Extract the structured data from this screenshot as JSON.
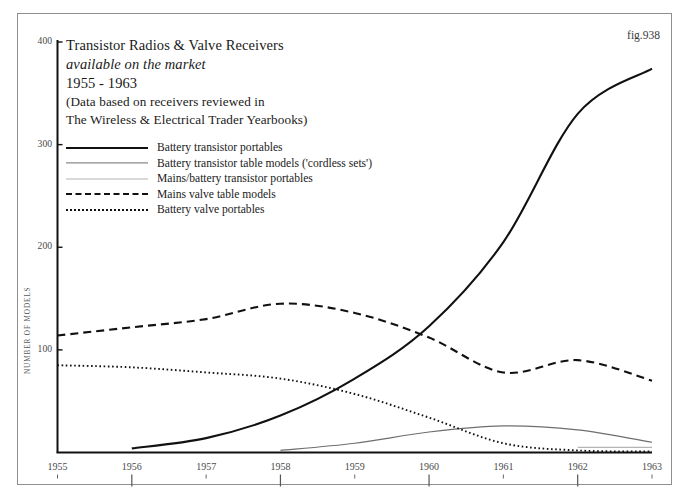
{
  "figure": {
    "fig_label": "fig.938",
    "title_lines": [
      "Transistor Radios & Valve Receivers",
      "available on the market",
      "1955 - 1963",
      "(Data based on receivers reviewed in",
      "The Wireless & Electrical Trader Yearbooks)"
    ]
  },
  "chart_data": {
    "type": "line",
    "title": "Transistor Radios & Valve Receivers available on the market 1955 - 1963",
    "subtitle": "(Data based on receivers reviewed in The Wireless & Electrical Trader Yearbooks)",
    "xlabel": "",
    "ylabel": "NUMBER OF MODELS",
    "xlim": [
      1955,
      1963
    ],
    "ylim": [
      0,
      400
    ],
    "grid": false,
    "legend_position": "upper-left",
    "x": [
      1955,
      1956,
      1957,
      1958,
      1959,
      1960,
      1961,
      1962,
      1963
    ],
    "xticklabels": [
      "1955",
      "1956",
      "1957",
      "1958",
      "1959",
      "1960",
      "1961",
      "1962",
      "1963"
    ],
    "yticks": [
      100,
      200,
      300,
      400
    ],
    "yticklabels": [
      "100",
      "200",
      "300",
      "400"
    ],
    "series": [
      {
        "name": "Battery transistor portables",
        "style": "solid-thick",
        "color": "#111111",
        "values": [
          null,
          4,
          14,
          36,
          72,
          123,
          205,
          330,
          374
        ]
      },
      {
        "name": "Battery transistor table models ('cordless sets')",
        "style": "solid-medium",
        "color": "#6e6e6e",
        "values": [
          null,
          null,
          null,
          2,
          9,
          20,
          26,
          22,
          10
        ]
      },
      {
        "name": "Mains/battery transistor portables",
        "style": "solid-light",
        "color": "#b4b4b4",
        "values": [
          null,
          null,
          null,
          null,
          null,
          null,
          null,
          5,
          5
        ]
      },
      {
        "name": "Mains valve table models",
        "style": "dashed",
        "color": "#111111",
        "values": [
          114,
          122,
          130,
          145,
          136,
          112,
          78,
          90,
          70
        ]
      },
      {
        "name": "Battery valve portables",
        "style": "dotted",
        "color": "#111111",
        "values": [
          85,
          83,
          78,
          72,
          57,
          34,
          9,
          2,
          1
        ]
      }
    ]
  }
}
